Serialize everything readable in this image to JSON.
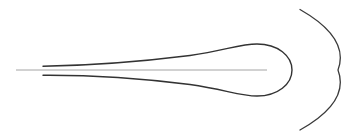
{
  "diagram": {
    "background": "#ffffff",
    "axis_line": {
      "x1": 16,
      "y1": 70,
      "x2": 267,
      "y2": 70,
      "color": "#9a9a9a",
      "width": 0.9
    },
    "loop": {
      "path": "M 43 66.3 C 90 65.5, 130 63, 190 55.5 C 225 50.5, 240 44, 257 44 C 278 44, 292 56, 292 70 C 292 84, 278 96, 257 96 C 240 96, 225 89.5, 190 84.5 C 130 77, 90 75, 43 75.3",
      "color": "#333333",
      "width": 1.4
    },
    "arc": {
      "path": "M 300 9.5 Q 350 38, 338 70 Q 350 102, 300 130",
      "color": "#3a3a3a",
      "width": 1.3
    }
  }
}
